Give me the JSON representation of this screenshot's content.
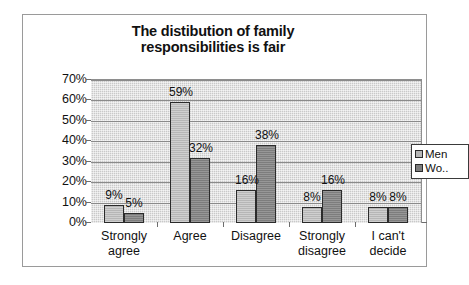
{
  "chart_data": {
    "type": "bar",
    "title": "The distibution of family responsibilities is fair",
    "title_lines": [
      "The distibution of family",
      "responsibilities is fair"
    ],
    "categories": [
      "Strongly agree",
      "Agree",
      "Disagree",
      "Strongly disagree",
      "I can't decide"
    ],
    "category_lines": [
      [
        "Strongly",
        "agree"
      ],
      [
        "Agree",
        ""
      ],
      [
        "Disagree",
        ""
      ],
      [
        "Strongly",
        "disagree"
      ],
      [
        "I can't",
        "decide"
      ]
    ],
    "series": [
      {
        "name": "Men",
        "legend_label": "Men",
        "color": "#b6b6b6",
        "values": [
          9,
          59,
          16,
          8,
          8
        ],
        "labels": [
          "9%",
          "59%",
          "16%",
          "8%",
          "8%"
        ]
      },
      {
        "name": "Women",
        "legend_label": "Wo..",
        "color": "#7d7d7d",
        "values": [
          5,
          32,
          38,
          16,
          8
        ],
        "labels": [
          "5%",
          "32%",
          "38%",
          "16%",
          "8%"
        ]
      }
    ],
    "xlabel": "",
    "ylabel": "",
    "ylim": [
      0,
      70
    ],
    "ytick_values": [
      70,
      60,
      50,
      40,
      30,
      20,
      10,
      0
    ],
    "ytick_labels": [
      "70%",
      "60%",
      "50%",
      "40%",
      "30%",
      "20%",
      "10%",
      "0%"
    ],
    "grid": true,
    "legend_position": "right",
    "plot_background": "#c9c9c9",
    "frame_border": "#9a9a9a"
  }
}
